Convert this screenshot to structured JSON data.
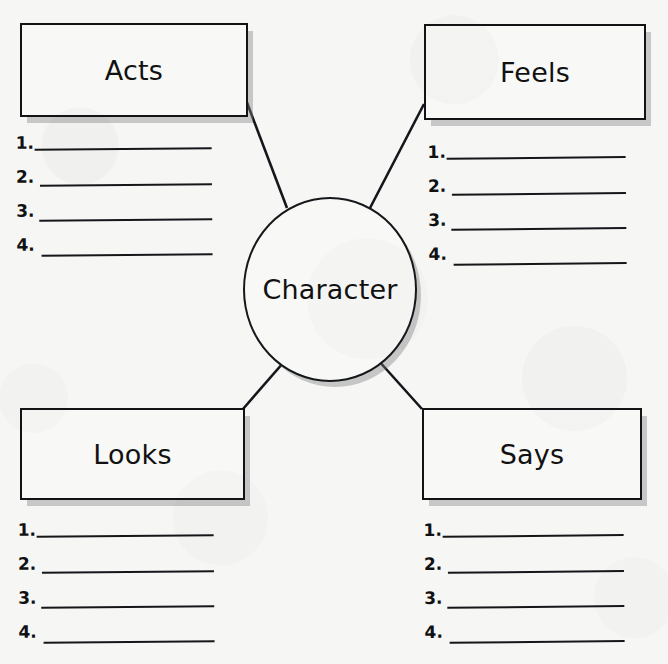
{
  "worksheet": {
    "type": "character-web-graphic-organizer",
    "center": {
      "label": "Character"
    },
    "nodes": [
      {
        "id": "acts",
        "label": "Acts",
        "lines": [
          "1.",
          "2.",
          "3.",
          "4."
        ]
      },
      {
        "id": "feels",
        "label": "Feels",
        "lines": [
          "1.",
          "2.",
          "3.",
          "4."
        ]
      },
      {
        "id": "looks",
        "label": "Looks",
        "lines": [
          "1.",
          "2.",
          "3.",
          "4."
        ]
      },
      {
        "id": "says",
        "label": "Says",
        "lines": [
          "1.",
          "2.",
          "3.",
          "4."
        ]
      }
    ],
    "colors": {
      "ink": "#111315",
      "paper": "#f6f6f5",
      "shadow": "#8a8a8a"
    }
  }
}
